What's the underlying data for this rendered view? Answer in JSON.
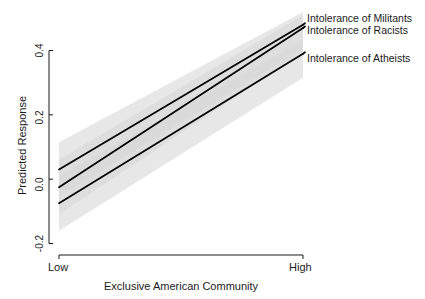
{
  "chart_data": {
    "type": "line",
    "title": "",
    "xlabel": "Exclusive American Community",
    "ylabel": "Predicted Response",
    "x": [
      0,
      1
    ],
    "xtick_labels": [
      "Low",
      "High"
    ],
    "xlim": [
      0,
      1
    ],
    "ylim": [
      -0.26,
      0.52
    ],
    "ytick_labels": [
      "-0.2",
      "0.0",
      "0.2",
      "0.4"
    ],
    "ytick_values": [
      -0.2,
      0.0,
      0.2,
      0.4
    ],
    "grid": false,
    "legend_position": "right-inline",
    "line_color": "#000000",
    "band_color": "#d9d9d9",
    "series": [
      {
        "name": "Intolerance of Militants",
        "values": [
          0.03,
          0.48
        ],
        "ci_lower": [
          -0.055,
          0.405
        ],
        "ci_upper": [
          0.115,
          0.52
        ],
        "label_y": 0.472
      },
      {
        "name": "Intolerance of Racists",
        "values": [
          -0.025,
          0.47
        ],
        "ci_lower": [
          -0.11,
          0.395
        ],
        "ci_upper": [
          0.06,
          0.51
        ],
        "label_y": 0.43
      },
      {
        "name": "Intolerance of Atheists",
        "values": [
          -0.075,
          0.39
        ],
        "ci_lower": [
          -0.16,
          0.315
        ],
        "ci_upper": [
          0.01,
          0.43
        ],
        "label_y": 0.31
      }
    ]
  },
  "labels": {
    "ylabel": "Predicted Response",
    "xlabel": "Exclusive American Community",
    "xtick_low": "Low",
    "xtick_high": "High",
    "ytick_0": "-0.2",
    "ytick_1": "0.0",
    "ytick_2": "0.2",
    "ytick_3": "0.4",
    "series_0": "Intolerance of Militants",
    "series_1": "Intolerance of Racists",
    "series_2": "Intolerance of Atheists"
  }
}
